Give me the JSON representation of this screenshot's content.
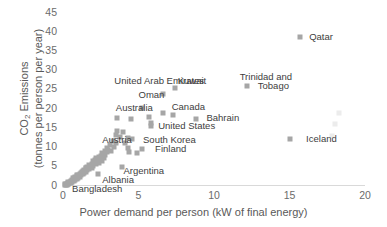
{
  "chart_data": {
    "type": "scatter",
    "title": "",
    "xlabel": "Power demand per person (kW of final energy)",
    "ylabel_line1": "CO2 Emissions",
    "ylabel_line2": "(tonnes per person per year)",
    "xlim": [
      0,
      20
    ],
    "ylim": [
      0,
      45
    ],
    "xticks": [
      0,
      5,
      10,
      15,
      20
    ],
    "yticks": [
      0,
      5,
      10,
      15,
      20,
      25,
      30,
      35,
      40,
      45
    ],
    "grid": false,
    "legend": "none",
    "marker_color": "#a6a6a6",
    "marker_shape": "square",
    "axis_color": "#d9d9d9",
    "tick_text_color": "#6b6b6b",
    "axis_title_color": "#595959",
    "label_text_color": "#404040",
    "annotations": [
      {
        "text": "Qatar",
        "x": 16.3,
        "y": 38.6
      },
      {
        "text": "Trinidad and",
        "x": 11.7,
        "y": 28.2
      },
      {
        "text": "Tobago",
        "x": 12.9,
        "y": 25.8
      },
      {
        "text": "Kuwait",
        "x": 7.6,
        "y": 27.0
      },
      {
        "text": "United Arab Emirates",
        "x": 3.4,
        "y": 27.0
      },
      {
        "text": "Oman",
        "x": 5.0,
        "y": 23.4
      },
      {
        "text": "Canada",
        "x": 7.2,
        "y": 20.4
      },
      {
        "text": "Australia",
        "x": 3.5,
        "y": 19.9
      },
      {
        "text": "Bahrain",
        "x": 9.5,
        "y": 17.4
      },
      {
        "text": "United States",
        "x": 6.3,
        "y": 15.3
      },
      {
        "text": "Iceland",
        "x": 16.1,
        "y": 12.0
      },
      {
        "text": "South Korea",
        "x": 5.3,
        "y": 11.7
      },
      {
        "text": "Austria",
        "x": 2.6,
        "y": 11.6
      },
      {
        "text": "Finland",
        "x": 6.1,
        "y": 9.4
      },
      {
        "text": "Argentina",
        "x": 4.0,
        "y": 3.6
      },
      {
        "text": "Albania",
        "x": 2.6,
        "y": 1.3
      },
      {
        "text": "Bangladesh",
        "x": 0.6,
        "y": -1.1
      }
    ],
    "points": [
      {
        "x": 15.7,
        "y": 38.5
      },
      {
        "x": 12.2,
        "y": 25.8
      },
      {
        "x": 7.4,
        "y": 25.2
      },
      {
        "x": 6.6,
        "y": 23.6
      },
      {
        "x": 5.2,
        "y": 19.9
      },
      {
        "x": 6.6,
        "y": 18.8
      },
      {
        "x": 7.3,
        "y": 18.3
      },
      {
        "x": 8.8,
        "y": 17.2
      },
      {
        "x": 5.7,
        "y": 17.7
      },
      {
        "x": 3.6,
        "y": 17.3
      },
      {
        "x": 4.5,
        "y": 17.2
      },
      {
        "x": 5.8,
        "y": 16.1
      },
      {
        "x": 5.8,
        "y": 15.4
      },
      {
        "x": 3.6,
        "y": 14.0
      },
      {
        "x": 4.0,
        "y": 13.9
      },
      {
        "x": 3.5,
        "y": 13.0
      },
      {
        "x": 15.0,
        "y": 12.0
      },
      {
        "x": 4.3,
        "y": 12.1
      },
      {
        "x": 4.6,
        "y": 11.9
      },
      {
        "x": 3.3,
        "y": 11.4
      },
      {
        "x": 3.5,
        "y": 10.8
      },
      {
        "x": 3.1,
        "y": 10.4
      },
      {
        "x": 4.3,
        "y": 9.6
      },
      {
        "x": 5.2,
        "y": 9.4
      },
      {
        "x": 3.0,
        "y": 9.0
      },
      {
        "x": 2.9,
        "y": 8.6
      },
      {
        "x": 4.4,
        "y": 8.5
      },
      {
        "x": 4.9,
        "y": 8.4
      },
      {
        "x": 2.6,
        "y": 8.2
      },
      {
        "x": 2.8,
        "y": 7.9
      },
      {
        "x": 2.5,
        "y": 7.6
      },
      {
        "x": 2.4,
        "y": 7.2
      },
      {
        "x": 2.7,
        "y": 7.1
      },
      {
        "x": 2.2,
        "y": 6.9
      },
      {
        "x": 2.3,
        "y": 6.5
      },
      {
        "x": 2.6,
        "y": 6.3
      },
      {
        "x": 2.0,
        "y": 6.2
      },
      {
        "x": 2.1,
        "y": 5.9
      },
      {
        "x": 2.4,
        "y": 5.8
      },
      {
        "x": 1.9,
        "y": 5.5
      },
      {
        "x": 2.2,
        "y": 5.4
      },
      {
        "x": 1.7,
        "y": 5.2
      },
      {
        "x": 2.0,
        "y": 5.0
      },
      {
        "x": 1.8,
        "y": 4.8
      },
      {
        "x": 1.6,
        "y": 4.6
      },
      {
        "x": 1.9,
        "y": 4.5
      },
      {
        "x": 1.5,
        "y": 4.3
      },
      {
        "x": 1.7,
        "y": 4.1
      },
      {
        "x": 1.4,
        "y": 4.0
      },
      {
        "x": 1.6,
        "y": 3.8
      },
      {
        "x": 1.3,
        "y": 3.6
      },
      {
        "x": 3.9,
        "y": 4.6
      },
      {
        "x": 1.5,
        "y": 3.4
      },
      {
        "x": 1.2,
        "y": 3.2
      },
      {
        "x": 1.4,
        "y": 3.1
      },
      {
        "x": 1.1,
        "y": 2.9
      },
      {
        "x": 1.3,
        "y": 2.8
      },
      {
        "x": 1.0,
        "y": 2.6
      },
      {
        "x": 1.2,
        "y": 2.5
      },
      {
        "x": 0.9,
        "y": 2.3
      },
      {
        "x": 2.3,
        "y": 2.8
      },
      {
        "x": 1.1,
        "y": 2.2
      },
      {
        "x": 0.8,
        "y": 2.0
      },
      {
        "x": 1.0,
        "y": 1.9
      },
      {
        "x": 0.7,
        "y": 1.7
      },
      {
        "x": 0.9,
        "y": 1.6
      },
      {
        "x": 0.6,
        "y": 1.4
      },
      {
        "x": 0.8,
        "y": 1.3
      },
      {
        "x": 0.5,
        "y": 1.1
      },
      {
        "x": 0.7,
        "y": 1.0
      },
      {
        "x": 0.45,
        "y": 0.9
      },
      {
        "x": 0.6,
        "y": 0.8
      },
      {
        "x": 0.35,
        "y": 0.7
      },
      {
        "x": 0.5,
        "y": 0.6
      },
      {
        "x": 0.3,
        "y": 0.5
      },
      {
        "x": 0.4,
        "y": 0.45
      },
      {
        "x": 0.25,
        "y": 0.35
      },
      {
        "x": 0.35,
        "y": 0.3
      },
      {
        "x": 0.2,
        "y": 0.25
      },
      {
        "x": 0.3,
        "y": 0.2
      },
      {
        "x": 0.15,
        "y": 0.15
      },
      {
        "x": 0.25,
        "y": 0.12
      },
      {
        "x": 0.1,
        "y": 0.1
      },
      {
        "x": 0.2,
        "y": 0.08
      },
      {
        "x": 2.9,
        "y": 9.6
      },
      {
        "x": 3.2,
        "y": 8.8
      },
      {
        "x": 2.75,
        "y": 8.9
      },
      {
        "x": 2.45,
        "y": 6.8
      },
      {
        "x": 2.15,
        "y": 6.4
      },
      {
        "x": 1.85,
        "y": 5.0
      },
      {
        "x": 1.55,
        "y": 4.5
      },
      {
        "x": 1.25,
        "y": 3.5
      },
      {
        "x": 0.95,
        "y": 2.7
      },
      {
        "x": 0.65,
        "y": 1.9
      },
      {
        "x": 3.8,
        "y": 12.4
      },
      {
        "x": 4.1,
        "y": 11.0
      },
      {
        "x": 3.4,
        "y": 10.0
      }
    ],
    "faint_points": [
      {
        "x": 18.3,
        "y": 18.6
      },
      {
        "x": 18.0,
        "y": 15.9
      },
      {
        "x": 17.8,
        "y": 12.8
      }
    ]
  }
}
